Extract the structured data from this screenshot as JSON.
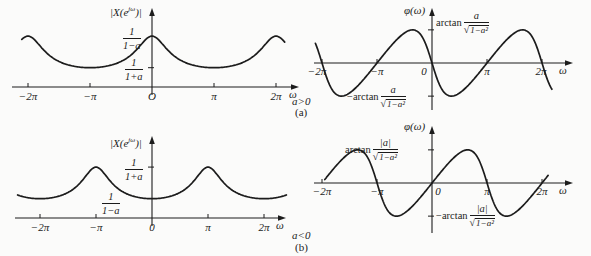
{
  "figure": {
    "condition_a": "a>0",
    "panel_a": "(a)",
    "condition_b": "a<0",
    "panel_b": "(b)"
  },
  "chart_data": [
    {
      "id": "magnitude-a-positive",
      "type": "line",
      "ylabel": {
        "pre": "|X(e",
        "sup": "jω",
        "post": ")|"
      },
      "xlabel": "ω",
      "formula": "|X(e^jω)| = 1/√(1 − 2a·cosω + a²)",
      "a": 0.45,
      "domain_pi": [
        -2.1,
        2.15
      ],
      "x_ticks": [
        {
          "label": "−2π",
          "value_pi": -2
        },
        {
          "label": "−π",
          "value_pi": -1
        },
        {
          "label": "O",
          "value_pi": 0
        },
        {
          "label": "π",
          "value_pi": 1
        },
        {
          "label": "2π",
          "value_pi": 2
        }
      ],
      "y_levels": [
        {
          "role": "maximum at ω=0, ±2π",
          "num": "1",
          "den": "1−a"
        },
        {
          "role": "minimum at ω=±π",
          "num": "1",
          "den": "1+a"
        }
      ]
    },
    {
      "id": "phase-a-positive",
      "type": "line",
      "ylabel": "φ(ω)",
      "xlabel": "ω",
      "formula": "φ(ω) = −arctan(a·sinω / (1 − a·cosω))",
      "a": 0.45,
      "domain_pi": [
        -2.12,
        2.18
      ],
      "x_ticks": [
        {
          "label": "−2π",
          "value_pi": -2
        },
        {
          "label": "−π",
          "value_pi": -1
        },
        {
          "label": "0",
          "value_pi": 0
        },
        {
          "label": "π",
          "value_pi": 1
        },
        {
          "label": "2π",
          "value_pi": 2
        }
      ],
      "y_levels": [
        {
          "role": "maximum",
          "prefix": "arctan",
          "num": "a",
          "radical": "√",
          "radicand": "1−a²"
        },
        {
          "role": "minimum",
          "prefix": "−arctan",
          "num": "a",
          "radical": "√",
          "radicand": "1−a²"
        }
      ]
    },
    {
      "id": "magnitude-a-negative",
      "type": "line",
      "ylabel": {
        "pre": "|X(e",
        "sup": "jω",
        "post": ")|"
      },
      "xlabel": "ω",
      "formula": "|X(e^jω)| = 1/√(1 − 2a·cosω + a²)",
      "a": -0.45,
      "domain_pi": [
        -2.4,
        2.4
      ],
      "x_ticks": [
        {
          "label": "−2π",
          "value_pi": -2
        },
        {
          "label": "−π",
          "value_pi": -1
        },
        {
          "label": "0",
          "value_pi": 0
        },
        {
          "label": "π",
          "value_pi": 1
        },
        {
          "label": "2π",
          "value_pi": 2
        }
      ],
      "y_levels": [
        {
          "role": "maximum at ω=±π",
          "num": "1",
          "den": "1+a"
        },
        {
          "role": "minimum at ω=0, ±2π",
          "num": "1",
          "den": "1−a"
        }
      ]
    },
    {
      "id": "phase-a-negative",
      "type": "line",
      "ylabel": "φ(ω)",
      "xlabel": "ω",
      "formula": "φ(ω) = −arctan(a·sinω / (1 − a·cosω))",
      "a": -0.45,
      "domain_pi": [
        -1.95,
        2.12
      ],
      "x_ticks": [
        {
          "label": "−2π",
          "value_pi": -2
        },
        {
          "label": "−π",
          "value_pi": -1
        },
        {
          "label": "0",
          "value_pi": 0
        },
        {
          "label": "π",
          "value_pi": 1
        },
        {
          "label": "2π",
          "value_pi": 2
        }
      ],
      "y_levels": [
        {
          "role": "maximum",
          "prefix": "arctan",
          "num": "|a|",
          "radical": "√",
          "radicand": "1−a²"
        },
        {
          "role": "minimum",
          "prefix": "−arctan",
          "num": "|a|",
          "radical": "√",
          "radicand": "1−a²"
        }
      ]
    }
  ]
}
